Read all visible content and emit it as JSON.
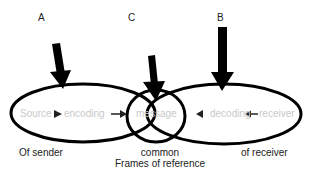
{
  "diagram": {
    "type": "communication-model",
    "arrows": [
      {
        "label": "A"
      },
      {
        "label": "C"
      },
      {
        "label": "B"
      }
    ],
    "nodes": {
      "source": "Source",
      "encoding": "encoding",
      "message": "message",
      "decoding": "decoding",
      "receiver": "receiver"
    },
    "captions": {
      "sender": "Of sender",
      "common_line1": "common",
      "common_line2": "Frames of reference",
      "receiver": "of receiver"
    },
    "colors": {
      "stroke": "#000000",
      "node_text": "#c9c9c9",
      "caption_text": "#222222"
    }
  }
}
